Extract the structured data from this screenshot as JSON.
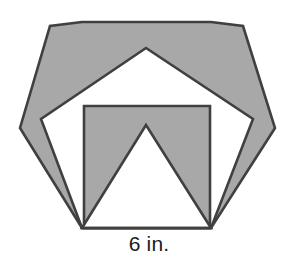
{
  "figure": {
    "label": "6 in.",
    "colors": {
      "fill": "#a8a8a8",
      "stroke": "#404040",
      "background": "#ffffff",
      "text": "#1b1b1b"
    },
    "stroke_width": 2.6
  },
  "chart_data": {
    "type": "diagram",
    "annotations": [
      "6 in."
    ],
    "xlabel": "",
    "ylabel": "",
    "shapes": [
      {
        "name": "hexagon",
        "sides": 6,
        "fill": "#a8a8a8",
        "stroke": "#404040",
        "points": "82,228 20,128 50,26 82,22 211,22 243,26 275,128 211,228"
      },
      {
        "name": "pentagon",
        "sides": 5,
        "fill": "#ffffff",
        "stroke": "#404040",
        "points": "82,228 41,119 146,48 253,119 211,228"
      },
      {
        "name": "square",
        "sides": 4,
        "fill": "#a8a8a8",
        "stroke": "#404040",
        "points": "84,228 84,106 210,106 210,228"
      },
      {
        "name": "inner-triangle-notch",
        "sides": 3,
        "fill": "#ffffff",
        "stroke": "#404040",
        "points": "82,228 146,125 211,228"
      }
    ],
    "base_edge": {
      "from": [
        82,
        228
      ],
      "to": [
        211,
        228
      ],
      "length_label": "6 in."
    }
  }
}
